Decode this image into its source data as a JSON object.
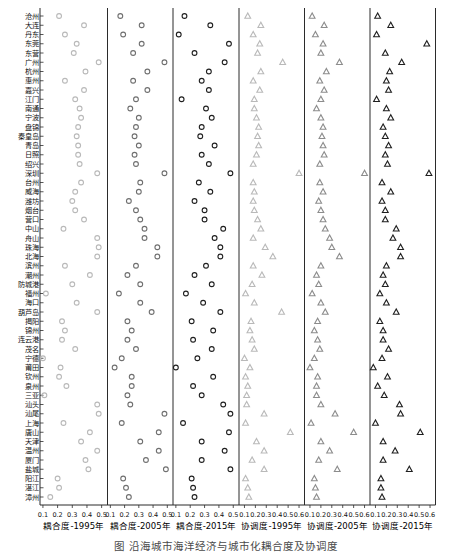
{
  "figure": {
    "caption_partial": "图  沿海城市海洋经济与城市化耦合度及协调度"
  },
  "chart_data": {
    "type": "scatter",
    "subtype": "horizontal-dot-plot-small-multiples",
    "grid": "off",
    "cities": [
      "沧州",
      "大连",
      "丹东",
      "东莞",
      "东营",
      "广州",
      "杭州",
      "惠州",
      "嘉兴",
      "江门",
      "南通",
      "宁波",
      "盘锦",
      "秦皇岛",
      "青岛",
      "日照",
      "绍兴",
      "深圳",
      "台州",
      "威海",
      "潍坊",
      "烟台",
      "营口",
      "中山",
      "舟山",
      "珠海",
      "北海",
      "滨州",
      "潮州",
      "防城港",
      "福州",
      "海口",
      "葫芦岛",
      "揭阳",
      "锦州",
      "连云港",
      "茂名",
      "宁德",
      "莆田",
      "钦州",
      "泉州",
      "三亚",
      "汕头",
      "汕尾",
      "上海",
      "唐山",
      "天津",
      "温州",
      "厦门",
      "盐城",
      "阳江",
      "湛江",
      "漳州"
    ],
    "panels": [
      {
        "label": "耦合度-1995年",
        "marker": "circle",
        "color": "#b9b9b9",
        "xticks": [
          "0.1",
          "0.2",
          "0.3",
          "0.4",
          "0.5"
        ],
        "xlim": [
          0.08,
          0.54
        ],
        "values": [
          0.21,
          0.38,
          0.25,
          0.33,
          0.31,
          0.48,
          0.39,
          0.25,
          0.38,
          0.32,
          0.35,
          0.36,
          0.34,
          0.33,
          0.34,
          0.34,
          0.35,
          0.47,
          0.36,
          0.32,
          0.3,
          0.32,
          0.38,
          0.24,
          0.47,
          0.48,
          0.47,
          0.25,
          0.42,
          0.3,
          0.12,
          0.33,
          0.47,
          0.23,
          0.25,
          0.23,
          0.32,
          0.1,
          0.22,
          0.21,
          0.26,
          0.11,
          0.47,
          0.48,
          0.24,
          0.42,
          0.36,
          0.47,
          0.39,
          0.41,
          0.2,
          0.21,
          0.15
        ]
      },
      {
        "label": "耦合度-2005年",
        "marker": "circle",
        "color": "#6f6f6f",
        "xticks": [
          "0.1",
          "0.2",
          "0.3",
          "0.4",
          "0.5"
        ],
        "xlim": [
          0.08,
          0.54
        ],
        "values": [
          0.17,
          0.32,
          0.19,
          0.32,
          0.26,
          0.48,
          0.36,
          0.26,
          0.36,
          0.28,
          0.24,
          0.3,
          0.28,
          0.27,
          0.3,
          0.27,
          0.28,
          0.48,
          0.31,
          0.3,
          0.23,
          0.28,
          0.31,
          0.34,
          0.34,
          0.43,
          0.43,
          0.28,
          0.22,
          0.31,
          0.16,
          0.31,
          0.39,
          0.22,
          0.25,
          0.22,
          0.28,
          0.18,
          0.13,
          0.25,
          0.25,
          0.22,
          0.24,
          0.48,
          0.18,
          0.44,
          0.31,
          0.44,
          0.35,
          0.49,
          0.19,
          0.21,
          0.23
        ]
      },
      {
        "label": "耦合度-2015年",
        "marker": "circle",
        "color": "#1f1f1f",
        "xticks": [
          "0.1",
          "0.2",
          "0.3",
          "0.4",
          "0.5"
        ],
        "xlim": [
          0.08,
          0.54
        ],
        "values": [
          0.16,
          0.34,
          0.12,
          0.47,
          0.23,
          0.44,
          0.33,
          0.28,
          0.33,
          0.14,
          0.31,
          0.35,
          0.28,
          0.27,
          0.37,
          0.28,
          0.33,
          0.48,
          0.26,
          0.34,
          0.23,
          0.3,
          0.3,
          0.43,
          0.37,
          0.41,
          0.41,
          0.31,
          0.23,
          0.35,
          0.17,
          0.29,
          0.41,
          0.21,
          0.36,
          0.22,
          0.35,
          0.25,
          0.1,
          0.36,
          0.22,
          0.28,
          0.43,
          0.48,
          0.15,
          0.47,
          0.28,
          0.44,
          0.28,
          0.48,
          0.21,
          0.22,
          0.23
        ]
      },
      {
        "label": "协调度-1995年",
        "marker": "triangle",
        "color": "#b9b9b9",
        "xticks": [
          "0.1",
          "0.2",
          "0.3",
          "0.4",
          "0.5",
          "0.6"
        ],
        "xlim": [
          0.05,
          0.65
        ],
        "values": [
          0.13,
          0.25,
          0.18,
          0.24,
          0.22,
          0.45,
          0.25,
          0.18,
          0.24,
          0.19,
          0.19,
          0.21,
          0.23,
          0.22,
          0.23,
          0.21,
          0.18,
          0.6,
          0.18,
          0.19,
          0.18,
          0.19,
          0.22,
          0.25,
          0.18,
          0.29,
          0.36,
          0.18,
          0.26,
          0.17,
          0.11,
          0.19,
          0.44,
          0.16,
          0.15,
          0.17,
          0.19,
          0.1,
          0.15,
          0.11,
          0.13,
          0.12,
          0.12,
          0.28,
          0.11,
          0.52,
          0.21,
          0.28,
          0.17,
          0.28,
          0.11,
          0.13,
          0.14
        ]
      },
      {
        "label": "协调度-2005年",
        "marker": "triangle",
        "color": "#8c8c8c",
        "xticks": [
          "0.1",
          "0.2",
          "0.3",
          "0.4",
          "0.5",
          "0.6"
        ],
        "xlim": [
          0.05,
          0.65
        ],
        "values": [
          0.12,
          0.23,
          0.15,
          0.22,
          0.2,
          0.37,
          0.25,
          0.19,
          0.23,
          0.2,
          0.16,
          0.2,
          0.22,
          0.21,
          0.22,
          0.23,
          0.19,
          0.6,
          0.19,
          0.22,
          0.18,
          0.2,
          0.22,
          0.24,
          0.28,
          0.3,
          0.37,
          0.2,
          0.16,
          0.18,
          0.12,
          0.2,
          0.24,
          0.17,
          0.14,
          0.17,
          0.19,
          0.14,
          0.1,
          0.17,
          0.16,
          0.16,
          0.2,
          0.33,
          0.11,
          0.5,
          0.2,
          0.28,
          0.18,
          0.35,
          0.14,
          0.15,
          0.16
        ]
      },
      {
        "label": "协调度-2015年",
        "marker": "triangle",
        "color": "#1f1f1f",
        "xticks": [
          "0.1",
          "0.2",
          "0.3",
          "0.4",
          "0.5",
          "0.6"
        ],
        "xlim": [
          0.05,
          0.65
        ],
        "values": [
          0.12,
          0.24,
          0.11,
          0.57,
          0.19,
          0.34,
          0.23,
          0.2,
          0.22,
          0.11,
          0.2,
          0.24,
          0.17,
          0.19,
          0.22,
          0.19,
          0.21,
          0.59,
          0.16,
          0.24,
          0.16,
          0.19,
          0.19,
          0.29,
          0.26,
          0.33,
          0.33,
          0.2,
          0.17,
          0.19,
          0.14,
          0.2,
          0.29,
          0.14,
          0.17,
          0.17,
          0.22,
          0.16,
          0.08,
          0.21,
          0.12,
          0.18,
          0.32,
          0.33,
          0.1,
          0.51,
          0.17,
          0.28,
          0.17,
          0.41,
          0.15,
          0.15,
          0.16
        ]
      }
    ]
  }
}
